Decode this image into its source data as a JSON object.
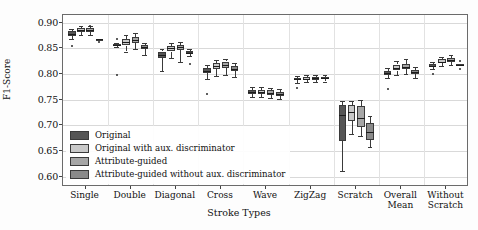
{
  "chart_data": {
    "type": "box",
    "title": "",
    "xlabel": "Stroke Types",
    "ylabel": "F1-Score",
    "ylim": [
      0.58,
      0.915
    ],
    "yticks": [
      "0.90",
      "0.85",
      "0.80",
      "0.75",
      "0.70",
      "0.65",
      "0.60"
    ],
    "ytick_values": [
      0.9,
      0.85,
      0.8,
      0.75,
      0.7,
      0.65,
      0.6
    ],
    "grid": true,
    "legend_position": "lower left",
    "categories": [
      "Single",
      "Double",
      "Diagonal",
      "Cross",
      "Wave",
      "ZigZag",
      "Scratch",
      "Overall\nMean",
      "Without\nScratch"
    ],
    "series": [
      {
        "name": "Original",
        "color": "#555555",
        "boxes": [
          {
            "category": "Single",
            "whisker_low": 0.869,
            "q1": 0.8745,
            "median": 0.879,
            "q3": 0.883,
            "whisker_high": 0.888,
            "fliers": [
              0.8545
            ]
          },
          {
            "category": "Double",
            "whisker_low": 0.852,
            "q1": 0.8545,
            "median": 0.8565,
            "q3": 0.858,
            "whisker_high": 0.86,
            "fliers": [
              0.869,
              0.798
            ]
          },
          {
            "category": "Diagonal",
            "whisker_low": 0.806,
            "q1": 0.831,
            "median": 0.8375,
            "q3": 0.844,
            "whisker_high": 0.849,
            "fliers": []
          },
          {
            "category": "Cross",
            "whisker_low": 0.79,
            "q1": 0.8025,
            "median": 0.807,
            "q3": 0.8115,
            "whisker_high": 0.8185,
            "fliers": [
              0.762
            ]
          },
          {
            "category": "Wave",
            "whisker_low": 0.7555,
            "q1": 0.762,
            "median": 0.765,
            "q3": 0.769,
            "whisker_high": 0.774,
            "fliers": []
          },
          {
            "category": "ZigZag",
            "whisker_low": 0.783,
            "q1": 0.788,
            "median": 0.79,
            "q3": 0.7925,
            "whisker_high": 0.796,
            "fliers": [
              0.773
            ]
          },
          {
            "category": "Scratch",
            "whisker_low": 0.612,
            "q1": 0.67,
            "median": 0.72,
            "q3": 0.739,
            "whisker_high": 0.747,
            "fliers": []
          },
          {
            "category": "Overall Mean",
            "whisker_low": 0.793,
            "q1": 0.7985,
            "median": 0.802,
            "q3": 0.8065,
            "whisker_high": 0.812,
            "fliers": [
              0.77
            ]
          },
          {
            "category": "Without Scratch",
            "whisker_low": 0.81,
            "q1": 0.814,
            "median": 0.8165,
            "q3": 0.82,
            "whisker_high": 0.8245,
            "fliers": [
              0.801
            ]
          }
        ]
      },
      {
        "name": "Original with aux. discriminator",
        "color": "#c9c9c9",
        "boxes": [
          {
            "category": "Single",
            "whisker_low": 0.876,
            "q1": 0.882,
            "median": 0.885,
            "q3": 0.889,
            "whisker_high": 0.893,
            "fliers": []
          },
          {
            "category": "Double",
            "whisker_low": 0.844,
            "q1": 0.8555,
            "median": 0.862,
            "q3": 0.869,
            "whisker_high": 0.8755,
            "fliers": []
          },
          {
            "category": "Diagonal",
            "whisker_low": 0.831,
            "q1": 0.844,
            "median": 0.85,
            "q3": 0.855,
            "whisker_high": 0.8605,
            "fliers": []
          },
          {
            "category": "Cross",
            "whisker_low": 0.7955,
            "q1": 0.809,
            "median": 0.8155,
            "q3": 0.8215,
            "whisker_high": 0.828,
            "fliers": []
          },
          {
            "category": "Wave",
            "whisker_low": 0.756,
            "q1": 0.7615,
            "median": 0.765,
            "q3": 0.769,
            "whisker_high": 0.7745,
            "fliers": []
          },
          {
            "category": "ZigZag",
            "whisker_low": 0.784,
            "q1": 0.788,
            "median": 0.7905,
            "q3": 0.7935,
            "whisker_high": 0.7975,
            "fliers": []
          },
          {
            "category": "Scratch",
            "whisker_low": 0.684,
            "q1": 0.709,
            "median": 0.727,
            "q3": 0.739,
            "whisker_high": 0.7475,
            "fliers": []
          },
          {
            "category": "Overall Mean",
            "whisker_low": 0.798,
            "q1": 0.807,
            "median": 0.812,
            "q3": 0.8185,
            "whisker_high": 0.825,
            "fliers": []
          },
          {
            "category": "Without Scratch",
            "whisker_low": 0.816,
            "q1": 0.821,
            "median": 0.8245,
            "q3": 0.8285,
            "whisker_high": 0.833,
            "fliers": []
          }
        ]
      },
      {
        "name": "Attribute-guided",
        "color": "#a6a6a6",
        "boxes": [
          {
            "category": "Single",
            "whisker_low": 0.876,
            "q1": 0.8825,
            "median": 0.8865,
            "q3": 0.89,
            "whisker_high": 0.8945,
            "fliers": [
              0.8935
            ]
          },
          {
            "category": "Double",
            "whisker_low": 0.8485,
            "q1": 0.861,
            "median": 0.867,
            "q3": 0.873,
            "whisker_high": 0.88,
            "fliers": []
          },
          {
            "category": "Diagonal",
            "whisker_low": 0.8235,
            "q1": 0.8465,
            "median": 0.853,
            "q3": 0.857,
            "whisker_high": 0.8625,
            "fliers": []
          },
          {
            "category": "Cross",
            "whisker_low": 0.798,
            "q1": 0.812,
            "median": 0.818,
            "q3": 0.8245,
            "whisker_high": 0.83,
            "fliers": []
          },
          {
            "category": "Wave",
            "whisker_low": 0.754,
            "q1": 0.76,
            "median": 0.764,
            "q3": 0.7685,
            "whisker_high": 0.773,
            "fliers": []
          },
          {
            "category": "ZigZag",
            "whisker_low": 0.7845,
            "q1": 0.789,
            "median": 0.7915,
            "q3": 0.7945,
            "whisker_high": 0.799,
            "fliers": []
          },
          {
            "category": "Scratch",
            "whisker_low": 0.679,
            "q1": 0.6975,
            "median": 0.7145,
            "q3": 0.737,
            "whisker_high": 0.749,
            "fliers": []
          },
          {
            "category": "Overall Mean",
            "whisker_low": 0.8,
            "q1": 0.809,
            "median": 0.8145,
            "q3": 0.82,
            "whisker_high": 0.8285,
            "fliers": []
          },
          {
            "category": "Without Scratch",
            "whisker_low": 0.8175,
            "q1": 0.824,
            "median": 0.828,
            "q3": 0.832,
            "whisker_high": 0.8375,
            "fliers": []
          }
        ]
      },
      {
        "name": "Attribute-guided without aux. discriminator",
        "color": "#8a8a8a",
        "boxes": [
          {
            "category": "Single",
            "whisker_low": 0.8665,
            "q1": 0.867,
            "median": 0.8675,
            "q3": 0.868,
            "whisker_high": 0.8685,
            "fliers": [
              0.862
            ]
          },
          {
            "category": "Double",
            "whisker_low": 0.8375,
            "q1": 0.849,
            "median": 0.853,
            "q3": 0.856,
            "whisker_high": 0.861,
            "fliers": []
          },
          {
            "category": "Diagonal",
            "whisker_low": 0.835,
            "q1": 0.84,
            "median": 0.842,
            "q3": 0.8445,
            "whisker_high": 0.848,
            "fliers": [
              0.819
            ]
          },
          {
            "category": "Cross",
            "whisker_low": 0.794,
            "q1": 0.8065,
            "median": 0.8105,
            "q3": 0.8155,
            "whisker_high": 0.8215,
            "fliers": []
          },
          {
            "category": "Wave",
            "whisker_low": 0.752,
            "q1": 0.758,
            "median": 0.7615,
            "q3": 0.7655,
            "whisker_high": 0.7705,
            "fliers": []
          },
          {
            "category": "ZigZag",
            "whisker_low": 0.7855,
            "q1": 0.7895,
            "median": 0.7915,
            "q3": 0.794,
            "whisker_high": 0.7975,
            "fliers": []
          },
          {
            "category": "Scratch",
            "whisker_low": 0.658,
            "q1": 0.672,
            "median": 0.688,
            "q3": 0.705,
            "whisker_high": 0.719,
            "fliers": []
          },
          {
            "category": "Overall Mean",
            "whisker_low": 0.793,
            "q1": 0.7995,
            "median": 0.8035,
            "q3": 0.808,
            "whisker_high": 0.814,
            "fliers": []
          },
          {
            "category": "Without Scratch",
            "whisker_low": 0.8175,
            "q1": 0.818,
            "median": 0.8185,
            "q3": 0.819,
            "whisker_high": 0.8195,
            "fliers": [
              0.8255,
              0.8095
            ]
          }
        ]
      }
    ],
    "legend": [
      {
        "label": "Original",
        "color": "#555555"
      },
      {
        "label": "Original with aux. discriminator",
        "color": "#c9c9c9"
      },
      {
        "label": "Attribute-guided",
        "color": "#a6a6a6"
      },
      {
        "label": "Attribute-guided without aux. discriminator",
        "color": "#8a8a8a"
      }
    ]
  }
}
